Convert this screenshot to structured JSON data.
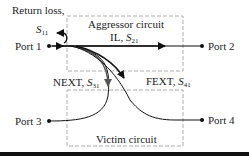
{
  "diagram": {
    "return_loss": {
      "label": "Return loss,",
      "param": "S",
      "sub": "11"
    },
    "aggressor": {
      "title": "Aggressor circuit",
      "il_label": "IL, ",
      "il_param": "S",
      "il_sub": "21"
    },
    "victim": {
      "title": "Victim circuit"
    },
    "next": {
      "label": "NEXT, ",
      "param": "S",
      "sub": "31"
    },
    "fext": {
      "label": "FEXT, ",
      "param": "S",
      "sub": "41"
    },
    "ports": {
      "p1": "Port 1",
      "p2": "Port 2",
      "p3": "Port 3",
      "p4": "Port 4"
    },
    "colors": {
      "line": "#111111",
      "box": "#9a9a9a",
      "gray_arrow": "#555555"
    }
  }
}
